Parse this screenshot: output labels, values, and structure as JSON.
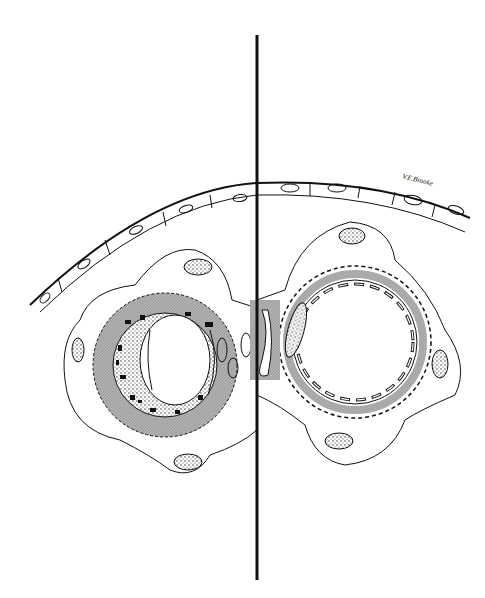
{
  "figure": {
    "type": "biological cross-section illustration",
    "panels": [
      {
        "side": "left",
        "description": "capillary cross-section with pericyte, dense granular deposits and thickened basement membrane"
      },
      {
        "side": "right",
        "description": "normal capillary cross-section with fenestrated endothelium and scalloped basement membrane"
      }
    ],
    "divider": {
      "x": 257,
      "y_start": 35,
      "y_end": 580
    },
    "colors": {
      "ink": "#111111",
      "membrane": "#a8a8a8",
      "background": "#ffffff"
    }
  },
  "signature": "V.E.Brooke"
}
